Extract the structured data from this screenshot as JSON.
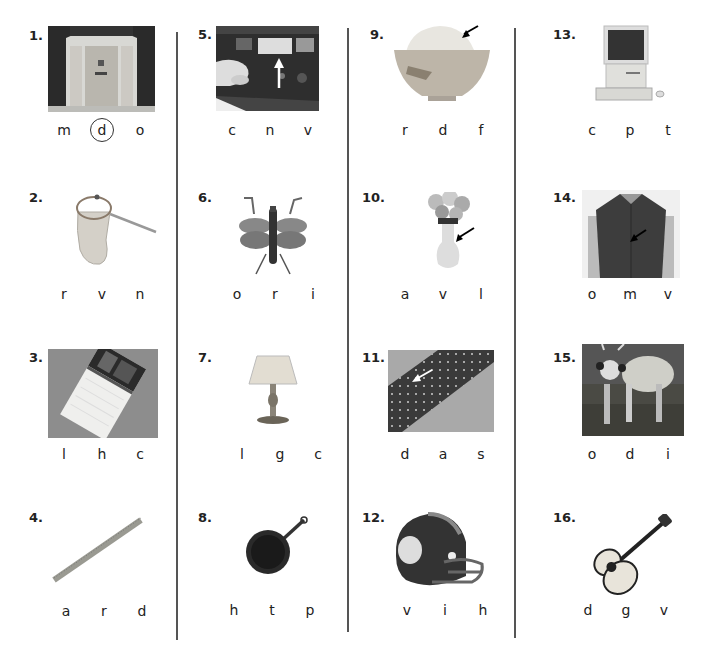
{
  "worksheet": {
    "items": [
      {
        "number": "1.",
        "picture": "door",
        "letters": [
          "m",
          "d",
          "o"
        ],
        "circled_index": 1
      },
      {
        "number": "2.",
        "picture": "net",
        "letters": [
          "r",
          "v",
          "n"
        ]
      },
      {
        "number": "3.",
        "picture": "calendar",
        "letters": [
          "l",
          "h",
          "c"
        ]
      },
      {
        "number": "4.",
        "picture": "ruler",
        "letters": [
          "a",
          "r",
          "d"
        ]
      },
      {
        "number": "5.",
        "picture": "vcr-slot",
        "letters": [
          "c",
          "n",
          "v"
        ]
      },
      {
        "number": "6.",
        "picture": "insect",
        "letters": [
          "o",
          "r",
          "i"
        ]
      },
      {
        "number": "7.",
        "picture": "lamp",
        "letters": [
          "l",
          "g",
          "c"
        ]
      },
      {
        "number": "8.",
        "picture": "pan",
        "letters": [
          "h",
          "t",
          "p"
        ]
      },
      {
        "number": "9.",
        "picture": "rice-bowl",
        "letters": [
          "r",
          "d",
          "f"
        ]
      },
      {
        "number": "10.",
        "picture": "vase",
        "letters": [
          "a",
          "v",
          "l"
        ]
      },
      {
        "number": "11.",
        "picture": "dotted-fabric",
        "letters": [
          "d",
          "a",
          "s"
        ]
      },
      {
        "number": "12.",
        "picture": "helmet",
        "letters": [
          "v",
          "i",
          "h"
        ]
      },
      {
        "number": "13.",
        "picture": "computer",
        "letters": [
          "c",
          "p",
          "t"
        ]
      },
      {
        "number": "14.",
        "picture": "vest",
        "letters": [
          "o",
          "m",
          "v"
        ]
      },
      {
        "number": "15.",
        "picture": "ox",
        "letters": [
          "o",
          "d",
          "i"
        ]
      },
      {
        "number": "16.",
        "picture": "guitar",
        "letters": [
          "d",
          "g",
          "v"
        ]
      }
    ]
  }
}
